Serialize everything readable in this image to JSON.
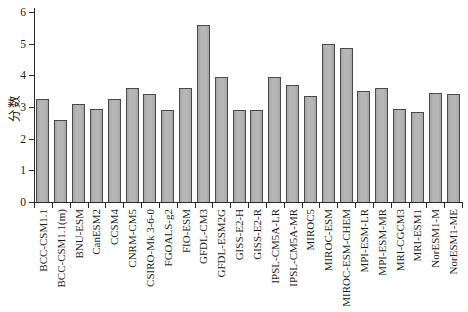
{
  "figure": {
    "width": 468,
    "height": 312,
    "background": "#ffffff"
  },
  "chart_data": {
    "type": "bar",
    "title": "",
    "xlabel": "",
    "ylabel": "分数",
    "ylim": [
      0,
      6
    ],
    "yticks": [
      0,
      1,
      2,
      3,
      4,
      5,
      6
    ],
    "grid": false,
    "legend": "none",
    "bar_fill": "#b6b6b6",
    "bar_fill_edge_shade": "#a6a6a6",
    "bar_border": "#4a4a4a",
    "axis_color": "#2b2b2b",
    "text_color": "#1a1a1a",
    "categories": [
      "BCC-CSM1.1",
      "BCC-CSM1.1(m)",
      "BNU-ESM",
      "CanESM2",
      "CCSM4",
      "CNRM-CM5",
      "CSIRO-Mk 3-6-0",
      "FGOALS-g2",
      "FIO-ESM",
      "GFDL-CM3",
      "GFDL-ESM2G",
      "GISS-E2-H",
      "GISS-E2-R",
      "IPSL-CM5A-LR",
      "IPSL-CM5A-MR",
      "MIROC5",
      "MIROC-ESM",
      "MIROC-ESM-CHEM",
      "MPI-ESM-LR",
      "MPI-ESM-MR",
      "MRI-CGCM3",
      "MRI-ESM1",
      "NorESM1-M",
      "NorESM1-ME"
    ],
    "values": [
      3.25,
      2.6,
      3.1,
      2.95,
      3.25,
      3.6,
      3.4,
      2.9,
      3.6,
      5.6,
      3.95,
      2.9,
      2.9,
      3.95,
      3.7,
      3.35,
      5.0,
      4.85,
      3.5,
      3.6,
      2.95,
      2.85,
      3.45,
      3.4
    ]
  }
}
